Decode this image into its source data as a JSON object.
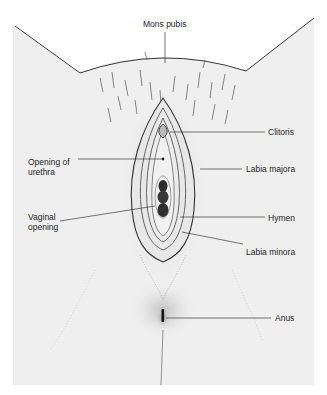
{
  "figure": {
    "background_color": "#efefef",
    "line_color": "#3a3a3a",
    "labels": [
      {
        "id": "mons-pubis",
        "text": "Mons pubis"
      },
      {
        "id": "clitoris",
        "text": "Clitoris"
      },
      {
        "id": "opening-of-urethra",
        "line1": "Opening of",
        "line2": "urethra"
      },
      {
        "id": "labia-majora",
        "text": "Labia majora"
      },
      {
        "id": "vaginal-opening",
        "line1": "Vaginal",
        "line2": "opening"
      },
      {
        "id": "hymen",
        "text": "Hymen"
      },
      {
        "id": "labia-minora",
        "text": "Labia minora"
      },
      {
        "id": "anus",
        "text": "Anus"
      }
    ]
  }
}
